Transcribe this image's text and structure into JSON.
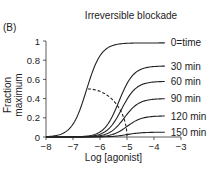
{
  "panel_label": "(B)",
  "chart_data": {
    "type": "line",
    "title": "Irreversible blockade",
    "xlabel": "Log [agonist]",
    "ylabel": "Fraction maximum",
    "xlim": [
      -8,
      -3
    ],
    "ylim": [
      0,
      1
    ],
    "xticks": [
      "−8",
      "−7",
      "−6",
      "−5",
      "−4",
      "−3"
    ],
    "yticks": [
      "0",
      "0.2",
      "0.4",
      "0.6",
      "0.8",
      "1"
    ],
    "grid": false,
    "legend_position": "inline-right",
    "series": [
      {
        "name": "0=time",
        "max": 0.98,
        "log_ec50": -6.5,
        "slope": 1.0
      },
      {
        "name": "30 min",
        "max": 0.74,
        "log_ec50": -5.3,
        "slope": 1.0
      },
      {
        "name": "60 min",
        "max": 0.58,
        "log_ec50": -5.2,
        "slope": 1.0
      },
      {
        "name": "90 min",
        "max": 0.4,
        "log_ec50": -5.1,
        "slope": 1.0
      },
      {
        "name": "120 min",
        "max": 0.22,
        "log_ec50": -5.0,
        "slope": 1.0
      },
      {
        "name": "150 min",
        "max": 0.05,
        "log_ec50": -5.0,
        "slope": 1.0
      }
    ],
    "annotations": [
      {
        "type": "dashed-curve",
        "description": "EC50 locus shifting from (-6.5, 0.49) down to (-5.0, 0)"
      }
    ]
  }
}
